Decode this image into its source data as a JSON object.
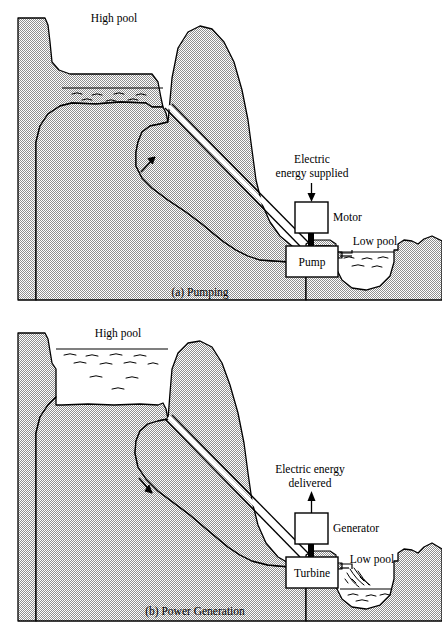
{
  "figure": {
    "panels": [
      {
        "id": "a",
        "caption": "(a) Pumping",
        "high_pool_label": "High pool",
        "low_pool_label": "Low pool",
        "energy_label_line1": "Electric",
        "energy_label_line2": "energy supplied",
        "machine_upper_label": "Motor",
        "machine_lower_label": "Pump",
        "high_pool_state": "low",
        "low_pool_state": "full",
        "flow_direction": "up",
        "energy_arrow_direction": "down"
      },
      {
        "id": "b",
        "caption": "(b) Power Generation",
        "high_pool_label": "High pool",
        "low_pool_label": "Low pool",
        "energy_label_line1": "Electric energy",
        "energy_label_line2": "delivered",
        "machine_upper_label": "Generator",
        "machine_lower_label": "Turbine",
        "high_pool_state": "full",
        "low_pool_state": "low",
        "flow_direction": "down",
        "energy_arrow_direction": "up"
      }
    ]
  },
  "colors": {
    "ground_stipple": "#9a9a9a",
    "ground_base": "#c9c9c9",
    "outline": "#000000",
    "water": "#ffffff",
    "page_background": "#ffffff"
  }
}
